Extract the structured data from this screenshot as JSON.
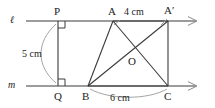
{
  "figure": {
    "kind": "geometry-diagram",
    "stroke_color": "#3a3a3a",
    "text_color": "#1c1c1c",
    "background": "#ffffff"
  },
  "lines": {
    "upper": {
      "name": "l",
      "label": "ℓ"
    },
    "lower": {
      "name": "m",
      "label": "m"
    }
  },
  "points": {
    "P": {
      "label": "P"
    },
    "Q": {
      "label": "Q"
    },
    "A": {
      "label": "A"
    },
    "A_prime": {
      "label": "A′"
    },
    "B": {
      "label": "B"
    },
    "C": {
      "label": "C"
    },
    "O": {
      "label": "O"
    }
  },
  "dimensions": {
    "height": {
      "value": "5 cm",
      "between": "P to Q"
    },
    "top": {
      "value": "4 cm",
      "between": "A to A′"
    },
    "base": {
      "value": "6 cm",
      "between": "B to C"
    }
  },
  "marks": {
    "right_angle_at_P": "right-angle-square",
    "right_angle_at_Q": "right-angle-square",
    "arrow_upper": "arrowhead-right",
    "arrow_lower": "arrowhead-right"
  }
}
